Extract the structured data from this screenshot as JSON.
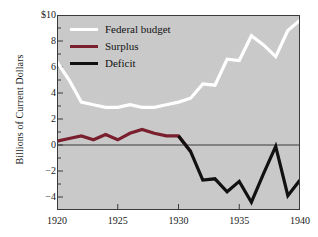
{
  "chart_data": {
    "type": "line",
    "title": "",
    "subtitle": "",
    "xlabel": "",
    "ylabel": "Billions of Current Dollars",
    "xlim": [
      1920,
      1940
    ],
    "ylim": [
      -5,
      10
    ],
    "grid": false,
    "background_color": "#c9c9c9",
    "zero_line": 0,
    "x": [
      1920,
      1921,
      1922,
      1923,
      1924,
      1925,
      1926,
      1927,
      1928,
      1929,
      1930,
      1931,
      1932,
      1933,
      1934,
      1935,
      1936,
      1937,
      1938,
      1939,
      1940
    ],
    "xticks": [
      1920,
      1925,
      1930,
      1935,
      1940
    ],
    "xticklabels": [
      "1920",
      "1925",
      "1930",
      "1935",
      "1940"
    ],
    "yticks": [
      -4,
      -2,
      0,
      2,
      4,
      6,
      8,
      10
    ],
    "yticklabels": [
      "−4",
      "−2",
      "0",
      "2",
      "4",
      "6",
      "8",
      "$10"
    ],
    "yminorticks": [
      -5,
      -3,
      -1,
      1,
      3,
      5,
      7,
      9
    ],
    "series": [
      {
        "name": "Federal budget",
        "color": "#ffffff",
        "linewidth": 3.2,
        "x": [
          1920,
          1921,
          1922,
          1923,
          1924,
          1925,
          1926,
          1927,
          1928,
          1929,
          1930,
          1931,
          1932,
          1933,
          1934,
          1935,
          1936,
          1937,
          1938,
          1939,
          1940
        ],
        "values": [
          6.4,
          5.0,
          3.3,
          3.1,
          2.9,
          2.9,
          3.1,
          2.9,
          2.9,
          3.1,
          3.3,
          3.6,
          4.7,
          4.6,
          6.6,
          6.5,
          8.4,
          7.7,
          6.8,
          8.8,
          9.6
        ]
      },
      {
        "name": "Surplus",
        "color": "#7a1f2e",
        "linewidth": 3.2,
        "x": [
          1920,
          1921,
          1922,
          1923,
          1924,
          1925,
          1926,
          1927,
          1928,
          1929,
          1930,
          1931
        ],
        "values": [
          0.3,
          0.5,
          0.7,
          0.4,
          0.8,
          0.4,
          0.9,
          1.2,
          0.9,
          0.7,
          0.7,
          -0.5
        ]
      },
      {
        "name": "Deficit",
        "color": "#111111",
        "linewidth": 3.2,
        "x": [
          1930,
          1931,
          1932,
          1933,
          1934,
          1935,
          1936,
          1937,
          1938,
          1939,
          1940
        ],
        "values": [
          0.7,
          -0.5,
          -2.7,
          -2.6,
          -3.6,
          -2.8,
          -4.4,
          -2.2,
          -0.1,
          -3.9,
          -2.7
        ]
      }
    ],
    "legend": {
      "position": "upper-left-inside",
      "entries": [
        {
          "label": "Federal budget",
          "color": "#ffffff"
        },
        {
          "label": "Surplus",
          "color": "#7a1f2e"
        },
        {
          "label": "Deficit",
          "color": "#111111"
        }
      ]
    }
  }
}
